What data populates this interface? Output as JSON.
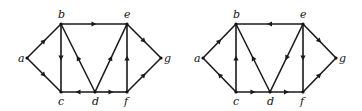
{
  "graphs": [
    {
      "name": "left-graph",
      "nodes": [
        {
          "id": "a",
          "x": 27,
          "y": 58,
          "lx": 18,
          "ly": 62
        },
        {
          "id": "b",
          "x": 61,
          "y": 24,
          "lx": 58,
          "ly": 18
        },
        {
          "id": "c",
          "x": 61,
          "y": 92,
          "lx": 58,
          "ly": 105
        },
        {
          "id": "d",
          "x": 95,
          "y": 92,
          "lx": 92,
          "ly": 105
        },
        {
          "id": "e",
          "x": 127,
          "y": 24,
          "lx": 124,
          "ly": 18
        },
        {
          "id": "f",
          "x": 127,
          "y": 92,
          "lx": 124,
          "ly": 105
        },
        {
          "id": "g",
          "x": 161,
          "y": 58,
          "lx": 164,
          "ly": 62
        }
      ],
      "edges": [
        {
          "from": "a",
          "to": "b"
        },
        {
          "from": "a",
          "to": "c"
        },
        {
          "from": "b",
          "to": "e"
        },
        {
          "from": "b",
          "to": "c"
        },
        {
          "from": "d",
          "to": "b"
        },
        {
          "from": "d",
          "to": "c"
        },
        {
          "from": "d",
          "to": "f"
        },
        {
          "from": "d",
          "to": "e"
        },
        {
          "from": "f",
          "to": "e"
        },
        {
          "from": "e",
          "to": "g"
        },
        {
          "from": "f",
          "to": "g"
        }
      ]
    },
    {
      "name": "right-graph",
      "nodes": [
        {
          "id": "a",
          "x": 203,
          "y": 58,
          "lx": 194,
          "ly": 62
        },
        {
          "id": "b",
          "x": 236,
          "y": 24,
          "lx": 233,
          "ly": 18
        },
        {
          "id": "c",
          "x": 236,
          "y": 92,
          "lx": 233,
          "ly": 105
        },
        {
          "id": "d",
          "x": 270,
          "y": 92,
          "lx": 267,
          "ly": 105
        },
        {
          "id": "e",
          "x": 303,
          "y": 24,
          "lx": 300,
          "ly": 18
        },
        {
          "id": "f",
          "x": 303,
          "y": 92,
          "lx": 300,
          "ly": 105
        },
        {
          "id": "g",
          "x": 336,
          "y": 58,
          "lx": 339,
          "ly": 62
        }
      ],
      "edges": [
        {
          "from": "a",
          "to": "b"
        },
        {
          "from": "c",
          "to": "a"
        },
        {
          "from": "e",
          "to": "b"
        },
        {
          "from": "c",
          "to": "b"
        },
        {
          "from": "d",
          "to": "b"
        },
        {
          "from": "c",
          "to": "d"
        },
        {
          "from": "d",
          "to": "f"
        },
        {
          "from": "e",
          "to": "d"
        },
        {
          "from": "e",
          "to": "f"
        },
        {
          "from": "e",
          "to": "g"
        },
        {
          "from": "f",
          "to": "g"
        }
      ]
    }
  ]
}
